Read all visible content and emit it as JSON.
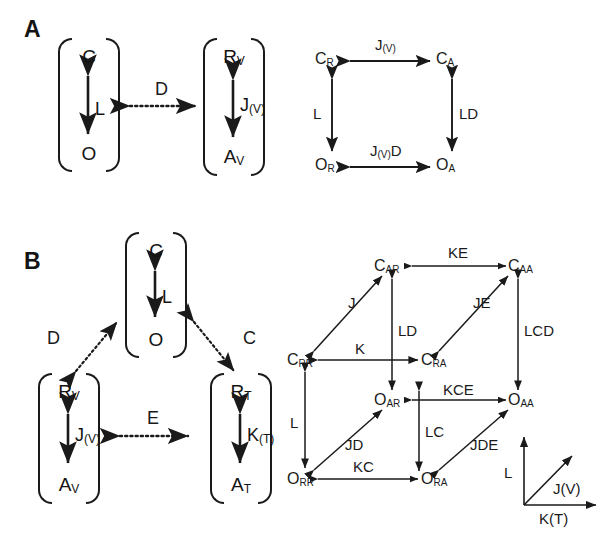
{
  "figure": {
    "background": "#ffffff",
    "stroke_color": "#1a1a1a"
  },
  "panels": [
    {
      "id": "A",
      "letter": "A",
      "left_diagram": {
        "boxes": [
          {
            "id": "box-co",
            "top_symbol": "C",
            "top_sub": "",
            "bottom_symbol": "O",
            "bottom_sub": "",
            "middle_label": "L",
            "middle_label_sub": ""
          },
          {
            "id": "box-rvav",
            "top_symbol": "R",
            "top_sub": "V",
            "bottom_symbol": "A",
            "bottom_sub": "V",
            "middle_label": "J",
            "middle_label_sub": "(V)"
          }
        ],
        "coupling": {
          "label": "D",
          "style": "dotted",
          "arrow": "double"
        }
      },
      "right_cycle": {
        "type": "square-cycle",
        "nodes": [
          {
            "id": "CR",
            "symbol": "C",
            "sub": "R",
            "pos": "top-left"
          },
          {
            "id": "CA",
            "symbol": "C",
            "sub": "A",
            "pos": "top-right"
          },
          {
            "id": "OR",
            "symbol": "O",
            "sub": "R",
            "pos": "bottom-left"
          },
          {
            "id": "OA",
            "symbol": "O",
            "sub": "A",
            "pos": "bottom-right"
          }
        ],
        "edges": [
          {
            "id": "edge-top",
            "from": "CR",
            "to": "CA",
            "label": "J",
            "label_sub": "(V)",
            "arrow": "double"
          },
          {
            "id": "edge-left",
            "from": "CR",
            "to": "OR",
            "label": "L",
            "label_sub": "",
            "arrow": "double"
          },
          {
            "id": "edge-right",
            "from": "CA",
            "to": "OA",
            "label": "LD",
            "label_sub": "",
            "arrow": "double"
          },
          {
            "id": "edge-bottom",
            "from": "OR",
            "to": "OA",
            "label": "J",
            "label_sub": "(V)",
            "label_suffix": "D",
            "arrow": "double"
          }
        ]
      }
    },
    {
      "id": "B",
      "letter": "B",
      "left_diagram": {
        "boxes": [
          {
            "id": "box-co-b",
            "top_symbol": "C",
            "top_sub": "",
            "bottom_symbol": "O",
            "bottom_sub": "",
            "middle_label": "L",
            "middle_label_sub": ""
          },
          {
            "id": "box-rvav-b",
            "top_symbol": "R",
            "top_sub": "V",
            "bottom_symbol": "A",
            "bottom_sub": "V",
            "middle_label": "J",
            "middle_label_sub": "(V)"
          },
          {
            "id": "box-rtat-b",
            "top_symbol": "R",
            "top_sub": "T",
            "bottom_symbol": "A",
            "bottom_sub": "T",
            "middle_label": "K",
            "middle_label_sub": "(T)"
          }
        ],
        "couplings": [
          {
            "id": "coupling-d",
            "label": "D",
            "style": "dotted",
            "arrow": "double"
          },
          {
            "id": "coupling-c",
            "label": "C",
            "style": "dotted",
            "arrow": "double"
          },
          {
            "id": "coupling-e",
            "label": "E",
            "style": "dotted",
            "arrow": "double"
          }
        ]
      },
      "right_cycle": {
        "type": "cube-cycle",
        "nodes": [
          {
            "id": "CAR",
            "symbol": "C",
            "sub": "AR",
            "pos": "back-top-left"
          },
          {
            "id": "CAA",
            "symbol": "C",
            "sub": "AA",
            "pos": "back-top-right"
          },
          {
            "id": "CRR",
            "symbol": "C",
            "sub": "RR",
            "pos": "front-top-left"
          },
          {
            "id": "CRA",
            "symbol": "C",
            "sub": "RA",
            "pos": "front-top-right"
          },
          {
            "id": "OAR",
            "symbol": "O",
            "sub": "AR",
            "pos": "back-bottom-left"
          },
          {
            "id": "OAA",
            "symbol": "O",
            "sub": "AA",
            "pos": "back-bottom-right"
          },
          {
            "id": "ORR",
            "symbol": "O",
            "sub": "RR",
            "pos": "front-bottom-left"
          },
          {
            "id": "ORA",
            "symbol": "O",
            "sub": "RA",
            "pos": "front-bottom-right"
          }
        ],
        "edges": [
          {
            "id": "edge-ke",
            "from": "CAA",
            "to": "CAR",
            "label": "KE",
            "arrow": "double"
          },
          {
            "id": "edge-j",
            "from": "CRR",
            "to": "CAR",
            "label": "J",
            "arrow": "double"
          },
          {
            "id": "edge-je",
            "from": "CRA",
            "to": "CAA",
            "label": "JE",
            "arrow": "double"
          },
          {
            "id": "edge-k",
            "from": "CRA",
            "to": "CRR",
            "label": "K",
            "arrow": "double"
          },
          {
            "id": "edge-ld",
            "from": "OAR",
            "to": "CAR",
            "label": "LD",
            "arrow": "double"
          },
          {
            "id": "edge-lcd",
            "from": "OAA",
            "to": "CAA",
            "label": "LCD",
            "arrow": "double"
          },
          {
            "id": "edge-l",
            "from": "ORR",
            "to": "CRR",
            "label": "L",
            "arrow": "double"
          },
          {
            "id": "edge-lc",
            "from": "ORA",
            "to": "CRA",
            "label": "LC",
            "arrow": "double"
          },
          {
            "id": "edge-kce",
            "from": "OAA",
            "to": "OAR",
            "label": "KCE",
            "arrow": "double"
          },
          {
            "id": "edge-jd",
            "from": "ORR",
            "to": "OAR",
            "label": "JD",
            "arrow": "double"
          },
          {
            "id": "edge-jde",
            "from": "ORA",
            "to": "OAA",
            "label": "JDE",
            "arrow": "double"
          },
          {
            "id": "edge-kc",
            "from": "ORA",
            "to": "ORR",
            "label": "KC",
            "arrow": "double"
          }
        ],
        "axis_legend": {
          "vertical_label": "L",
          "diagonal_label": "J(V)",
          "horizontal_label": "K(T)"
        }
      }
    }
  ]
}
